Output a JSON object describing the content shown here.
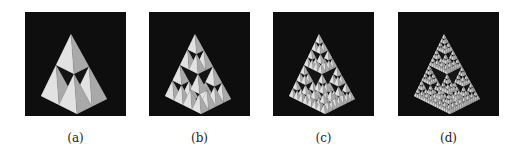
{
  "figure": {
    "panels": [
      {
        "caption": "(a)",
        "subject": "Sierpinski tetrahedron",
        "iteration": 1
      },
      {
        "caption": "(b)",
        "subject": "Sierpinski tetrahedron",
        "iteration": 2
      },
      {
        "caption": "(c)",
        "subject": "Sierpinski tetrahedron",
        "iteration": 3
      },
      {
        "caption": "(d)",
        "subject": "Sierpinski tetrahedron",
        "iteration": 4
      }
    ],
    "colors": {
      "background": "#0e0e0e",
      "face_left": "#c9c9c9",
      "face_right": "#a9a9a9",
      "face_front": "#e2e2e2",
      "hole": "#151515"
    }
  }
}
